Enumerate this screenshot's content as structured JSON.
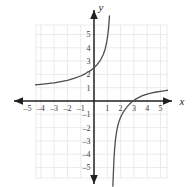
{
  "figure": {
    "name": "coordinate-plane-graph",
    "background_color": "#ffffff",
    "grid_color": "#e3e3e6",
    "axis_color": "#231f20",
    "curve_color": "#4d4d52",
    "x_axis_label": "x",
    "y_axis_label": "y"
  },
  "chart_data": {
    "type": "line",
    "title": "",
    "xlabel": "x",
    "ylabel": "y",
    "grid": true,
    "legend": null,
    "xlim": [
      -6.2,
      6.2
    ],
    "ylim": [
      -6.4,
      6.4
    ],
    "xticks": [
      -5,
      -4,
      -3,
      -2,
      -1,
      1,
      2,
      3,
      4,
      5
    ],
    "yticks": [
      -5,
      -4,
      -3,
      -2,
      -1,
      1,
      2,
      3,
      4,
      5
    ],
    "xtick_labels": [
      "–5",
      "–4",
      "–3",
      "–2",
      "–1",
      "1",
      "2",
      "3",
      "4",
      "5"
    ],
    "ytick_labels": [
      "–5",
      "–4",
      "–3",
      "–2",
      "–1",
      "1",
      "2",
      "3",
      "4",
      "5"
    ],
    "asymptotes": {
      "vertical_x": 1.3,
      "horizontal_y": 1.0
    },
    "intercepts": {
      "y_intercept": 2.5,
      "x_intercept": 2.7
    },
    "series": [
      {
        "name": "left-branch",
        "points": [
          [
            -6.2,
            1.12
          ],
          [
            -5.5,
            1.15
          ],
          [
            -5.0,
            1.18
          ],
          [
            -4.5,
            1.21
          ],
          [
            -4.0,
            1.25
          ],
          [
            -3.5,
            1.3
          ],
          [
            -3.0,
            1.36
          ],
          [
            -2.5,
            1.45
          ],
          [
            -2.0,
            1.55
          ],
          [
            -1.5,
            1.7
          ],
          [
            -1.0,
            1.88
          ],
          [
            -0.75,
            2.0
          ],
          [
            -0.5,
            2.14
          ],
          [
            -0.25,
            2.3
          ],
          [
            0.0,
            2.5
          ],
          [
            0.25,
            2.75
          ],
          [
            0.5,
            3.1
          ],
          [
            0.7,
            3.5
          ],
          [
            0.85,
            3.95
          ],
          [
            0.95,
            4.4
          ],
          [
            1.02,
            4.85
          ],
          [
            1.08,
            5.3
          ],
          [
            1.12,
            5.75
          ],
          [
            1.16,
            6.4
          ]
        ]
      },
      {
        "name": "right-branch",
        "points": [
          [
            1.42,
            -6.4
          ],
          [
            1.45,
            -5.6
          ],
          [
            1.5,
            -4.4
          ],
          [
            1.55,
            -3.6
          ],
          [
            1.62,
            -2.85
          ],
          [
            1.7,
            -2.3
          ],
          [
            1.8,
            -1.82
          ],
          [
            1.9,
            -1.48
          ],
          [
            2.0,
            -1.22
          ],
          [
            2.15,
            -0.92
          ],
          [
            2.3,
            -0.68
          ],
          [
            2.5,
            -0.42
          ],
          [
            2.7,
            -0.2
          ],
          [
            2.9,
            -0.02
          ],
          [
            3.2,
            0.18
          ],
          [
            3.6,
            0.38
          ],
          [
            4.0,
            0.52
          ],
          [
            4.5,
            0.64
          ],
          [
            5.0,
            0.73
          ],
          [
            5.5,
            0.8
          ],
          [
            6.2,
            0.88
          ]
        ]
      }
    ]
  }
}
